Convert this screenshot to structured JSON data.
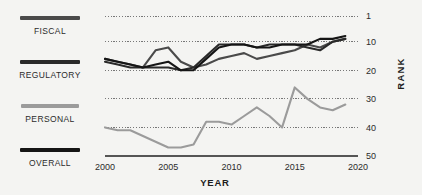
{
  "legend": {
    "items": [
      {
        "label": "FISCAL",
        "color": "#4a4a4a"
      },
      {
        "label": "REGULATORY",
        "color": "#2a2a2a"
      },
      {
        "label": "PERSONAL",
        "color": "#9b9b9b"
      },
      {
        "label": "OVERALL",
        "color": "#151515"
      }
    ]
  },
  "chart_data": {
    "type": "line",
    "title": "",
    "xlabel": "YEAR",
    "ylabel": "RANK",
    "xlim": [
      2000,
      2020
    ],
    "ylim": [
      1,
      50
    ],
    "y_inverted": true,
    "grid": true,
    "grid_style": "dotted-horizontal",
    "legend_position": "left",
    "xticks": [
      "2000",
      "2005",
      "2010",
      "2015",
      "2020"
    ],
    "xtick_values": [
      2000,
      2005,
      2010,
      2015,
      2020
    ],
    "yticks": [
      "1",
      "10",
      "20",
      "30",
      "40",
      "50"
    ],
    "ytick_values": [
      1,
      10,
      20,
      30,
      40,
      50
    ],
    "x": [
      2000,
      2001,
      2002,
      2003,
      2004,
      2005,
      2006,
      2007,
      2008,
      2009,
      2010,
      2011,
      2012,
      2013,
      2014,
      2015,
      2016,
      2017,
      2018,
      2019
    ],
    "series": [
      {
        "name": "FISCAL",
        "color": "#4a4a4a",
        "values": [
          16,
          17,
          18,
          19,
          13,
          12,
          17,
          19,
          18,
          16,
          15,
          14,
          16,
          15,
          14,
          13,
          11,
          12,
          10,
          9
        ]
      },
      {
        "name": "REGULATORY",
        "color": "#2a2a2a",
        "values": [
          17,
          18,
          19,
          19,
          19,
          19,
          20,
          19,
          15,
          11,
          11,
          11,
          12,
          11,
          11,
          11,
          12,
          13,
          10,
          9
        ]
      },
      {
        "name": "PERSONAL",
        "color": "#9b9b9b",
        "values": [
          40,
          41,
          41,
          43,
          45,
          47,
          47,
          46,
          38,
          38,
          39,
          36,
          33,
          36,
          40,
          26,
          30,
          33,
          34,
          32
        ]
      },
      {
        "name": "OVERALL",
        "color": "#151515",
        "values": [
          16,
          17,
          18,
          19,
          18,
          17,
          20,
          20,
          16,
          12,
          11,
          11,
          12,
          12,
          11,
          11,
          11,
          9,
          9,
          8
        ]
      }
    ]
  }
}
